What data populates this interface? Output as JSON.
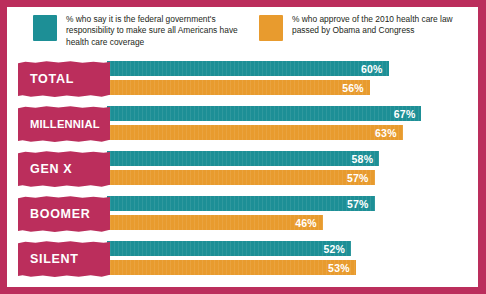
{
  "colors": {
    "frame": "#bb2e5c",
    "category_plaque": "#bb2e5c",
    "series_teal": "#1d8f96",
    "series_amber": "#e89b2e",
    "background": "#ffffff",
    "value_label": "#ffffff"
  },
  "legend": {
    "items": [
      {
        "key": "responsibility",
        "swatch_color": "#1d8f96",
        "text": "% who say it is the federal government's responsibility to make sure all Americans have health care coverage"
      },
      {
        "key": "approve_law",
        "swatch_color": "#e89b2e",
        "text": "% who approve of the 2010 health care law passed by Obama and Congress"
      }
    ]
  },
  "chart_data": {
    "type": "bar",
    "orientation": "horizontal",
    "title": "",
    "subtitle": "",
    "xlabel": "",
    "ylabel": "",
    "xlim": [
      0,
      75
    ],
    "grid": false,
    "legend_position": "top",
    "categories": [
      "TOTAL",
      "MILLENNIAL",
      "GEN X",
      "BOOMER",
      "SILENT"
    ],
    "series": [
      {
        "name": "% who say it is the federal government's responsibility to make sure all Americans have health care coverage",
        "short_name": "Federal responsibility",
        "color": "#1d8f96",
        "values": [
          60,
          67,
          58,
          57,
          52
        ],
        "labels": [
          "60%",
          "67%",
          "58%",
          "57%",
          "52%"
        ]
      },
      {
        "name": "% who approve of the 2010 health care law passed by Obama and Congress",
        "short_name": "Approve 2010 law",
        "color": "#e89b2e",
        "values": [
          56,
          63,
          57,
          46,
          53
        ],
        "labels": [
          "56%",
          "63%",
          "57%",
          "46%",
          "53%"
        ]
      }
    ]
  },
  "rows": [
    {
      "label": "TOTAL",
      "teal_value": 60,
      "teal_label": "60%",
      "amber_value": 56,
      "amber_label": "56%"
    },
    {
      "label": "MILLENNIAL",
      "teal_value": 67,
      "teal_label": "67%",
      "amber_value": 63,
      "amber_label": "63%"
    },
    {
      "label": "GEN X",
      "teal_value": 58,
      "teal_label": "58%",
      "amber_value": 57,
      "amber_label": "57%"
    },
    {
      "label": "BOOMER",
      "teal_value": 57,
      "teal_label": "57%",
      "amber_value": 46,
      "amber_label": "46%"
    },
    {
      "label": "SILENT",
      "teal_value": 52,
      "teal_label": "52%",
      "amber_value": 53,
      "amber_label": "53%"
    }
  ]
}
